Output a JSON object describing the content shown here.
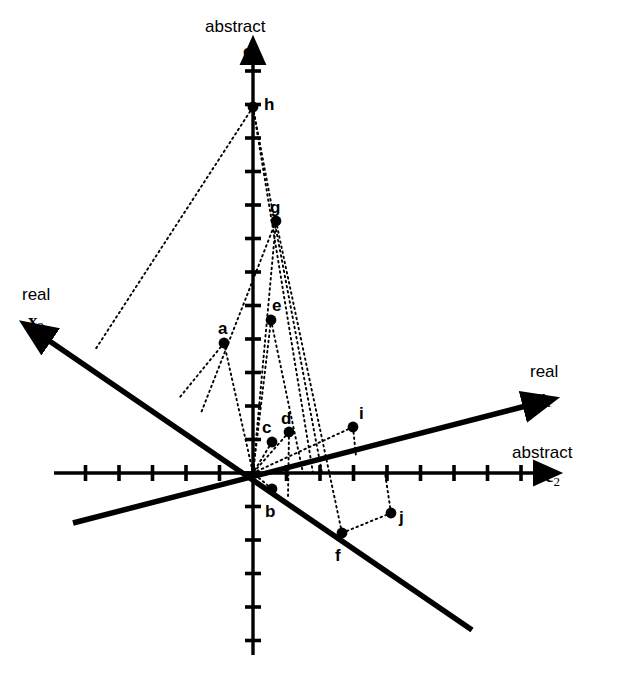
{
  "figure": {
    "background_color": "#ffffff",
    "stroke_color": "#000000",
    "width": 622,
    "height": 683
  },
  "axes": [
    {
      "id": "c1",
      "kind_label": "abstract",
      "symbol": "c",
      "subscript": "1",
      "orientation": "vertical",
      "style": "ticked",
      "kind_label_pos": {
        "x": 205,
        "y": 18
      },
      "symbol_pos": {
        "x": 243,
        "y": 41
      },
      "line": {
        "x1": 253,
        "y1": 655,
        "x2": 253,
        "y2": 62
      },
      "arrow": "end",
      "tick_spacing": 33.5,
      "tick_length": 16
    },
    {
      "id": "c2",
      "kind_label": "abstract",
      "symbol": "c",
      "subscript": "2",
      "orientation": "horizontal",
      "style": "ticked",
      "kind_label_pos": {
        "x": 512,
        "y": 444
      },
      "symbol_pos": {
        "x": 545,
        "y": 466
      },
      "line": {
        "x1": 54,
        "y1": 473,
        "x2": 536,
        "y2": 473
      },
      "arrow": "end",
      "tick_spacing": 33.5,
      "tick_length": 16
    },
    {
      "id": "x1",
      "kind_label": "real",
      "symbol": "x",
      "subscript": "1",
      "orientation": "oblique-up-right",
      "style": "plain",
      "kind_label_pos": {
        "x": 530,
        "y": 363
      },
      "symbol_pos": {
        "x": 536,
        "y": 387
      },
      "line": {
        "x1": 73,
        "y1": 523,
        "x2": 526,
        "y2": 406
      },
      "arrow": "end"
    },
    {
      "id": "x2",
      "kind_label": "real",
      "symbol": "x",
      "subscript": "2",
      "orientation": "oblique-up-left",
      "style": "plain",
      "kind_label_pos": {
        "x": 22,
        "y": 286
      },
      "symbol_pos": {
        "x": 28,
        "y": 311
      },
      "line": {
        "x1": 472,
        "y1": 630,
        "x2": 48,
        "y2": 340
      },
      "arrow": "end"
    }
  ],
  "origin": {
    "x": 253,
    "y": 473
  },
  "points": [
    {
      "label": "a",
      "x": 224,
      "y": 343,
      "label_pos": {
        "x": 218,
        "y": 320
      }
    },
    {
      "label": "b",
      "x": 272,
      "y": 489,
      "label_pos": {
        "x": 265,
        "y": 503
      }
    },
    {
      "label": "c",
      "x": 272,
      "y": 442,
      "label_pos": {
        "x": 262,
        "y": 419
      }
    },
    {
      "label": "d",
      "x": 289,
      "y": 432,
      "label_pos": {
        "x": 281,
        "y": 410
      }
    },
    {
      "label": "e",
      "x": 271,
      "y": 320,
      "label_pos": {
        "x": 272,
        "y": 297
      }
    },
    {
      "label": "f",
      "x": 342,
      "y": 533,
      "label_pos": {
        "x": 335,
        "y": 547
      }
    },
    {
      "label": "g",
      "x": 276,
      "y": 221,
      "label_pos": {
        "x": 270,
        "y": 199
      }
    },
    {
      "label": "h",
      "x": 253,
      "y": 107,
      "label_pos": {
        "x": 264,
        "y": 96
      }
    },
    {
      "label": "i",
      "x": 353,
      "y": 427,
      "label_pos": {
        "x": 359,
        "y": 405
      }
    },
    {
      "label": "j",
      "x": 391,
      "y": 513,
      "label_pos": {
        "x": 399,
        "y": 509
      }
    }
  ],
  "projection_lines": [
    {
      "from": "h",
      "to_x": 95,
      "to_y": 350
    },
    {
      "from": "h",
      "to_x": 253,
      "to_y": 473
    },
    {
      "from": "h",
      "to_x": 313,
      "to_y": 473
    },
    {
      "from": "h",
      "to_x": 322,
      "to_y": 473
    },
    {
      "from": "g",
      "to_x": 253,
      "to_y": 473
    },
    {
      "from": "g",
      "to_x": 201,
      "to_y": 413
    },
    {
      "from": "g",
      "to_x": 342,
      "to_y": 533
    },
    {
      "from": "e",
      "to_x": 253,
      "to_y": 473
    },
    {
      "from": "e",
      "to_x": 303,
      "to_y": 473
    },
    {
      "from": "a",
      "to_x": 253,
      "to_y": 473
    },
    {
      "from": "a",
      "to_x": 180,
      "to_y": 397
    },
    {
      "from": "c",
      "to_x": 253,
      "to_y": 473
    },
    {
      "from": "d",
      "to_x": 253,
      "to_y": 473
    },
    {
      "from": "d",
      "to_x": 288,
      "to_y": 498
    },
    {
      "from": "i",
      "to_x": 253,
      "to_y": 473
    },
    {
      "from": "i",
      "to_x": 356,
      "to_y": 456
    },
    {
      "from": "b",
      "to_x": 253,
      "to_y": 473
    },
    {
      "from": "f",
      "to_x": 391,
      "to_y": 513
    },
    {
      "from": "j",
      "to_x": 385,
      "to_y": 473
    }
  ]
}
